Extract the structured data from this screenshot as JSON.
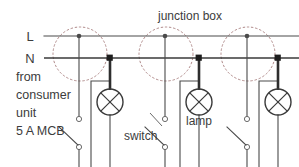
{
  "diagram": {
    "title_annotation": "junction box",
    "rails": [
      {
        "id": "live",
        "label": "L",
        "y": 36
      },
      {
        "id": "neutral",
        "label": "N",
        "y": 58
      }
    ],
    "source_note": {
      "lines": [
        "from",
        "consumer",
        "unit",
        "5 A MCB"
      ]
    },
    "annotations": {
      "junction_box": "junction box",
      "lamp": "lamp",
      "switch": "switch"
    },
    "colors": {
      "background": "#ffffff",
      "wire": "#4a4a4a",
      "wire_bold": "#2e2e2e",
      "junction_box_outline": "#b08a8a",
      "text": "#3c3c3c",
      "terminal_fill": "#ffffff"
    },
    "circuits": [
      {
        "name": "circuit-1",
        "junction_box_center_x": 80,
        "junction_box_center_y": 54,
        "junction_box_radius": 27,
        "live_node_x": 79,
        "neutral_node_x": 110,
        "lamp_center_x": 110,
        "lamp_center_y": 102,
        "lamp_radius": 13,
        "switch_top_terminal_x": 79,
        "switch_top_terminal_y": 119,
        "switch_bottom_terminal_x": 79,
        "switch_bottom_terminal_y": 147
      },
      {
        "name": "circuit-2",
        "junction_box_center_x": 166,
        "junction_box_center_y": 54,
        "junction_box_radius": 27,
        "live_node_x": 165,
        "neutral_node_x": 199,
        "lamp_center_x": 199,
        "lamp_center_y": 102,
        "lamp_radius": 13,
        "switch_top_terminal_x": 165,
        "switch_top_terminal_y": 119,
        "switch_bottom_terminal_x": 165,
        "switch_bottom_terminal_y": 147
      },
      {
        "name": "circuit-3",
        "junction_box_center_x": 248,
        "junction_box_center_y": 54,
        "junction_box_radius": 27,
        "live_node_x": 247,
        "neutral_node_x": 278,
        "lamp_center_x": 278,
        "lamp_center_y": 102,
        "lamp_radius": 13,
        "switch_top_terminal_x": 247,
        "switch_top_terminal_y": 119,
        "switch_bottom_terminal_x": 247,
        "switch_bottom_terminal_y": 147
      }
    ]
  }
}
